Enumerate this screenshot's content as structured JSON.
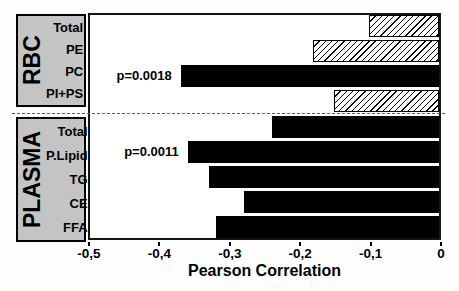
{
  "chart_data": {
    "type": "bar",
    "orientation": "horizontal",
    "title": "",
    "xlabel": "Pearson Correlation",
    "ylabel": "",
    "xlim": [
      -0.5,
      0
    ],
    "grid": false,
    "x_ticks": [
      {
        "value": -0.5,
        "label": "-0,5"
      },
      {
        "value": -0.4,
        "label": "-0,4"
      },
      {
        "value": -0.3,
        "label": "-0,3"
      },
      {
        "value": -0.2,
        "label": "-0,2"
      },
      {
        "value": -0.1,
        "label": "-0,1"
      },
      {
        "value": 0,
        "label": "0"
      }
    ],
    "groups": [
      {
        "name": "RBC",
        "items": [
          {
            "label": "Total",
            "value": -0.1,
            "fill": "hatched",
            "annotation": ""
          },
          {
            "label": "PE",
            "value": -0.18,
            "fill": "hatched",
            "annotation": ""
          },
          {
            "label": "PC",
            "value": -0.37,
            "fill": "solid",
            "annotation": "p=0.0018"
          },
          {
            "label": "PI+PS",
            "value": -0.15,
            "fill": "hatched",
            "annotation": ""
          }
        ]
      },
      {
        "name": "PLASMA",
        "items": [
          {
            "label": "Total",
            "value": -0.24,
            "fill": "solid",
            "annotation": ""
          },
          {
            "label": "P.Lipid",
            "value": -0.36,
            "fill": "solid",
            "annotation": "p=0.0011"
          },
          {
            "label": "TG",
            "value": -0.33,
            "fill": "solid",
            "annotation": ""
          },
          {
            "label": "CE",
            "value": -0.28,
            "fill": "solid",
            "annotation": ""
          },
          {
            "label": "FFA",
            "value": -0.32,
            "fill": "solid",
            "annotation": ""
          }
        ]
      }
    ],
    "colors": {
      "solid_bar": "#000000",
      "hatch_line": "#000000",
      "hatch_background": "#ffffff",
      "group_box_background": "#c4c4c4",
      "axis": "#000000"
    }
  }
}
